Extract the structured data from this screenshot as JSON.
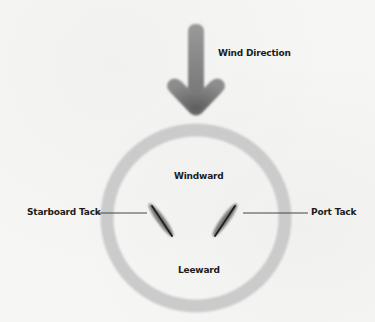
{
  "diagram": {
    "wind": {
      "label": "Wind Direction",
      "icon": "down-arrow-icon",
      "color": "#7a7a7a"
    },
    "circle": {
      "color": "#c9c9c9",
      "zones": {
        "top": "Windward",
        "bottom": "Leeward"
      }
    },
    "tacks": {
      "left": {
        "label": "Starboard Tack",
        "icon": "sail-boat-icon"
      },
      "right": {
        "label": "Port Tack",
        "icon": "sail-boat-icon"
      }
    },
    "colors": {
      "boat_hull": "#6e6e6e",
      "boat_sail": "#1e1e1e",
      "leader_line": "#444444",
      "text": "#1c1c1c"
    }
  }
}
